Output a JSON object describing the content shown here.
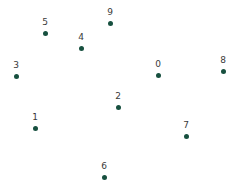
{
  "chart_data": {
    "type": "scatter",
    "title": "",
    "xlabel": "",
    "ylabel": "",
    "grid": false,
    "legend": false,
    "axes_visible": false,
    "xlim": [
      0,
      243
    ],
    "ylim": [
      188,
      0
    ],
    "marker_color": "#17503f",
    "label_color": "#3a3a3a",
    "background_color": "#ffffff",
    "marker_size_px": 5,
    "point_labels": [
      "0",
      "1",
      "2",
      "3",
      "4",
      "5",
      "6",
      "7",
      "8",
      "9"
    ],
    "points": [
      {
        "label": "0",
        "x": 158,
        "y": 75
      },
      {
        "label": "1",
        "x": 35,
        "y": 128
      },
      {
        "label": "2",
        "x": 118,
        "y": 107
      },
      {
        "label": "3",
        "x": 16,
        "y": 76
      },
      {
        "label": "4",
        "x": 81,
        "y": 48
      },
      {
        "label": "5",
        "x": 45,
        "y": 33
      },
      {
        "label": "6",
        "x": 104,
        "y": 177
      },
      {
        "label": "7",
        "x": 186,
        "y": 136
      },
      {
        "label": "8",
        "x": 223,
        "y": 71
      },
      {
        "label": "9",
        "x": 110,
        "y": 23
      }
    ]
  }
}
